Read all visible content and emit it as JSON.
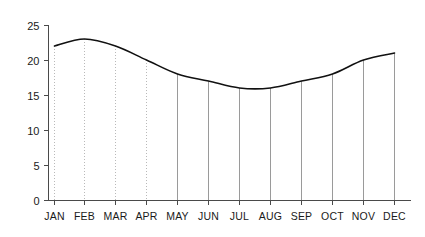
{
  "chart_data": {
    "type": "line",
    "title": "",
    "subtitle": "",
    "xlabel": "",
    "ylabel": "",
    "categories": [
      "JAN",
      "FEB",
      "MAR",
      "APR",
      "MAY",
      "JUN",
      "JUL",
      "AUG",
      "SEP",
      "OCT",
      "NOV",
      "DEC"
    ],
    "values": [
      22,
      23,
      22,
      20,
      18,
      17,
      16,
      16,
      17,
      18,
      20,
      21
    ],
    "series": [
      {
        "name": "",
        "values": [
          22,
          23,
          22,
          20,
          18,
          17,
          16,
          16,
          17,
          18,
          20,
          21
        ]
      }
    ],
    "ylim": [
      0,
      25
    ],
    "yticks": [
      0,
      5,
      10,
      15,
      20,
      25
    ],
    "ytick_labels": [
      "0",
      "5",
      "10",
      "15",
      "20",
      "25"
    ],
    "xtick_labels": [
      "JAN",
      "FEB",
      "MAR",
      "APR",
      "MAY",
      "JUN",
      "JUL",
      "AUG",
      "SEP",
      "OCT",
      "NOV",
      "DEC"
    ],
    "grid": {
      "vertical": true,
      "horizontal": false,
      "style": "dotted",
      "color": "#b9b9b9"
    },
    "legend": {
      "visible": false,
      "position": "none",
      "entries": []
    },
    "annotations": [],
    "line_color": "#111111",
    "axis_color": "#4a4a4a",
    "background_color": "#ffffff"
  },
  "axes": {
    "y_axis_name": "y-axis",
    "x_axis_name": "x-axis"
  }
}
